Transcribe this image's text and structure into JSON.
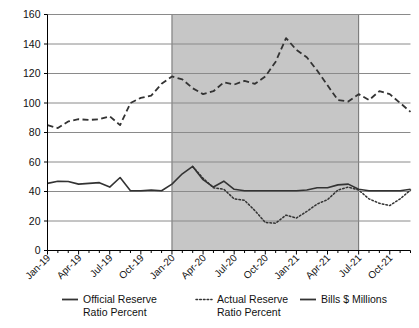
{
  "chart_data": {
    "type": "line",
    "title": "",
    "subtitle": "",
    "xlabel": "",
    "ylabel": "",
    "ylim": [
      0,
      160
    ],
    "ytick_values": [
      0,
      20,
      40,
      60,
      80,
      100,
      120,
      140,
      160
    ],
    "ytick_labels": [
      "0",
      "20",
      "40",
      "60",
      "80",
      "100",
      "120",
      "140",
      "160"
    ],
    "grid": true,
    "grid_axis": "y",
    "legend_position": "bottom",
    "x": [
      "Jan-19",
      "Feb-19",
      "Mar-19",
      "Apr-19",
      "May-19",
      "Jun-19",
      "Jul-19",
      "Aug-19",
      "Sep-19",
      "Oct-19",
      "Nov-19",
      "Dec-19",
      "Jan-20",
      "Feb-20",
      "Mar-20",
      "Apr-20",
      "May-20",
      "Jun-20",
      "Jul-20",
      "Aug-20",
      "Sep-20",
      "Oct-20",
      "Nov-20",
      "Dec-20",
      "Jan-21",
      "Feb-21",
      "Mar-21",
      "Apr-21",
      "May-21",
      "Jun-21",
      "Jul-21",
      "Aug-21",
      "Sep-21",
      "Oct-21",
      "Nov-21",
      "Dec-21"
    ],
    "xtick_labels": [
      "Jan-19",
      "Apr-19",
      "Jul-19",
      "Oct-19",
      "Jan-20",
      "Apr-20",
      "Jul-20",
      "Oct-20",
      "Jan-21",
      "Apr-21",
      "Jul-21",
      "Oct-21"
    ],
    "xtick_indices": [
      0,
      3,
      6,
      9,
      12,
      15,
      18,
      21,
      24,
      27,
      30,
      33
    ],
    "series": [
      {
        "name": "Official Reserve Ratio Percent",
        "style": "solid",
        "color": "#333333",
        "values": [
          45.5,
          47.0,
          46.8,
          45.0,
          45.5,
          46.0,
          43.0,
          49.5,
          40.5,
          40.5,
          41.0,
          40.5,
          45.0,
          52.0,
          57.0,
          48.0,
          43.0,
          47.0,
          41.5,
          40.5,
          40.5,
          40.5,
          40.5,
          40.5,
          40.5,
          41.0,
          42.5,
          42.5,
          44.5,
          45.0,
          41.5,
          40.5,
          40.5,
          40.5,
          40.5,
          41.5
        ]
      },
      {
        "name": "Actual Reserve Ratio Percent",
        "style": "dotted",
        "color": "#333333",
        "values": [
          null,
          null,
          null,
          null,
          null,
          null,
          null,
          null,
          null,
          null,
          null,
          null,
          null,
          null,
          57.0,
          49.0,
          42.5,
          41.5,
          35.0,
          34.0,
          27.0,
          19.0,
          18.5,
          24.0,
          22.0,
          26.5,
          31.5,
          34.5,
          41.0,
          43.0,
          41.0,
          35.0,
          32.0,
          30.5,
          35.0,
          41.0
        ]
      },
      {
        "name": "Bills $ Millions",
        "style": "dashed",
        "color": "#333333",
        "values": [
          85.0,
          83.0,
          87.5,
          89.0,
          88.5,
          89.0,
          91.0,
          85.0,
          100.0,
          103.5,
          105.0,
          113.0,
          118.0,
          116.0,
          110.0,
          106.0,
          108.0,
          114.0,
          112.5,
          115.0,
          113.0,
          118.0,
          128.0,
          144.0,
          136.0,
          131.0,
          122.0,
          112.0,
          102.0,
          101.0,
          106.0,
          102.0,
          108.0,
          106.0,
          100.0,
          94.0
        ]
      }
    ],
    "shaded_region": {
      "label": "",
      "start_x": "Jan-20",
      "end_x": "Jul-21",
      "start_index": 12,
      "end_index": 30,
      "color": "#c6c6c6"
    }
  },
  "legend": {
    "items": [
      {
        "label_line1": "Official Reserve",
        "label_line2": "Ratio Percent",
        "marker": "solid-line-icon"
      },
      {
        "label_line1": "Actual Reserve",
        "label_line2": "Ratio Percent",
        "marker": "dotted-line-icon"
      },
      {
        "label_line1": "Bills $ Millions",
        "label_line2": "",
        "marker": "dashed-line-icon"
      }
    ]
  },
  "colors": {
    "axis": "#000000",
    "grid": "#8a8a8a",
    "series": "#333333",
    "shade": "#c6c6c6",
    "background": "#ffffff"
  }
}
